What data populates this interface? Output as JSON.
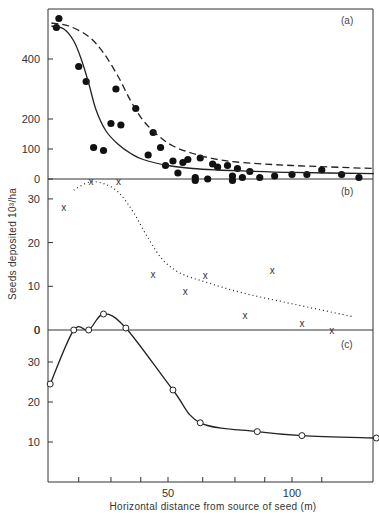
{
  "figure": {
    "ylabel": "Seeds deposited 10³/ha",
    "xlabel": "Horizontal distance from source of seed (m)",
    "xtick_labels": [
      "50",
      "100"
    ]
  },
  "chart_data": [
    {
      "panel": "(a)",
      "type": "scatter",
      "title": "",
      "xlabel": "Horizontal distance from source of seed (m)",
      "ylabel": "Seeds deposited 10³/ha",
      "xlim": [
        2.4,
        133
      ],
      "ylim": [
        0,
        540
      ],
      "yticks": [
        0,
        100,
        200,
        400
      ],
      "ytick_labels": [
        "0",
        "100",
        "200",
        "400"
      ],
      "grid": false,
      "series": [
        {
          "name": "observed",
          "marker": "filled-circle",
          "points": [
            [
              5,
              505
            ],
            [
              6,
              535
            ],
            [
              14,
              375
            ],
            [
              17,
              325
            ],
            [
              20,
              105
            ],
            [
              24,
              95
            ],
            [
              27,
              185
            ],
            [
              29,
              300
            ],
            [
              31,
              180
            ],
            [
              37,
              235
            ],
            [
              42,
              80
            ],
            [
              44,
              155
            ],
            [
              47,
              105
            ],
            [
              49,
              45
            ],
            [
              52,
              60
            ],
            [
              54,
              20
            ],
            [
              56,
              55
            ],
            [
              58,
              65
            ],
            [
              61,
              5
            ],
            [
              61,
              -5
            ],
            [
              63,
              70
            ],
            [
              66,
              0
            ],
            [
              68,
              50
            ],
            [
              70,
              40
            ],
            [
              74,
              45
            ],
            [
              76,
              -5
            ],
            [
              76,
              10
            ],
            [
              78,
              35
            ],
            [
              80,
              5
            ],
            [
              83,
              25
            ],
            [
              87,
              5
            ],
            [
              93,
              10
            ],
            [
              100,
              15
            ],
            [
              106,
              15
            ],
            [
              112,
              30
            ],
            [
              120,
              15
            ],
            [
              127,
              5
            ]
          ]
        },
        {
          "name": "fitted curve (solid)",
          "line": "solid",
          "points": [
            [
              3,
              510
            ],
            [
              8,
              500
            ],
            [
              12,
              460
            ],
            [
              15,
              400
            ],
            [
              18,
              320
            ],
            [
              21,
              230
            ],
            [
              25,
              160
            ],
            [
              30,
              115
            ],
            [
              35,
              85
            ],
            [
              40,
              65
            ],
            [
              50,
              45
            ],
            [
              60,
              35
            ],
            [
              70,
              30
            ],
            [
              80,
              27
            ],
            [
              100,
              22
            ],
            [
              133,
              18
            ]
          ]
        },
        {
          "name": "fitted curve (dashed)",
          "line": "dashed",
          "points": [
            [
              3,
              520
            ],
            [
              10,
              510
            ],
            [
              18,
              475
            ],
            [
              24,
              420
            ],
            [
              30,
              340
            ],
            [
              35,
              260
            ],
            [
              40,
              195
            ],
            [
              46,
              145
            ],
            [
              52,
              110
            ],
            [
              60,
              85
            ],
            [
              70,
              65
            ],
            [
              80,
              55
            ],
            [
              100,
              45
            ],
            [
              133,
              35
            ]
          ]
        }
      ]
    },
    {
      "panel": "(b)",
      "type": "scatter",
      "xlim": [
        2.4,
        133
      ],
      "ylim": [
        0,
        34
      ],
      "yticks": [
        0,
        10,
        20,
        30
      ],
      "ytick_labels": [
        "0",
        "10",
        "20",
        "30"
      ],
      "series": [
        {
          "name": "observed",
          "marker": "x",
          "points": [
            [
              8,
              28
            ],
            [
              19,
              34
            ],
            [
              30,
              34
            ],
            [
              44,
              12.7
            ],
            [
              57,
              8.8
            ],
            [
              65,
              12.5
            ],
            [
              81,
              3.3
            ],
            [
              92,
              13.6
            ],
            [
              104,
              1.6
            ],
            [
              116,
              0
            ]
          ]
        },
        {
          "name": "fitted curve (dotted)",
          "line": "dotted",
          "points": [
            [
              12,
              32
            ],
            [
              18,
              33.8
            ],
            [
              24,
              33.5
            ],
            [
              30,
              31.5
            ],
            [
              36,
              27
            ],
            [
              42,
              21
            ],
            [
              48,
              16
            ],
            [
              55,
              13
            ],
            [
              65,
              11
            ],
            [
              80,
              8.5
            ],
            [
              100,
              6
            ],
            [
              125,
              3
            ]
          ]
        }
      ]
    },
    {
      "panel": "(c)",
      "type": "line",
      "xlim": [
        2.4,
        133
      ],
      "ylim": [
        0,
        38
      ],
      "yticks": [
        10,
        20,
        30
      ],
      "ytick_labels": [
        "10",
        "20",
        "30"
      ],
      "top_zero_label": "0",
      "series": [
        {
          "name": "observed",
          "marker": "open-circle",
          "line": "solid",
          "points": [
            [
              2.5,
              24.5
            ],
            [
              12,
              38
            ],
            [
              18,
              38
            ],
            [
              24,
              42
            ],
            [
              33,
              38.5
            ],
            [
              52,
              23
            ],
            [
              63,
              14.8
            ],
            [
              86,
              12.6
            ],
            [
              104,
              11.6
            ],
            [
              134,
              11
            ]
          ]
        }
      ]
    }
  ]
}
